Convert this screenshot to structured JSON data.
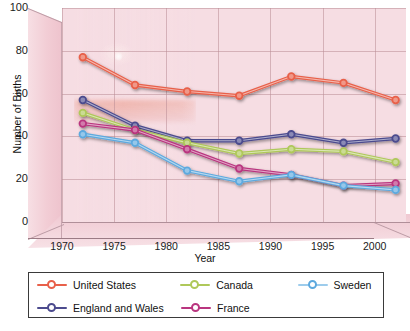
{
  "chart_data": {
    "type": "line",
    "title": "",
    "xlabel": "Year",
    "ylabel": "Number of Births",
    "x": [
      1972,
      1977,
      1982,
      1987,
      1992,
      1997,
      2002
    ],
    "xlim": [
      1970,
      2003
    ],
    "ylim": [
      0,
      100
    ],
    "xticks": [
      "1970",
      "1975",
      "1980",
      "1985",
      "1990",
      "1995",
      "2000"
    ],
    "xtick_values": [
      1970,
      1975,
      1980,
      1985,
      1990,
      1995,
      2000
    ],
    "yticks": [
      "0",
      "20",
      "40",
      "60",
      "80",
      "100"
    ],
    "ytick_values": [
      0,
      20,
      40,
      60,
      80,
      100
    ],
    "grid": true,
    "legend_position": "bottom",
    "series": [
      {
        "name": "United States",
        "color": "#E8604A",
        "values": [
          77,
          64,
          61,
          59,
          68,
          65,
          57
        ]
      },
      {
        "name": "England and Wales",
        "color": "#4C4B8E",
        "values": [
          57,
          45,
          38,
          38,
          41,
          37,
          39
        ]
      },
      {
        "name": "Canada",
        "color": "#AFC85A",
        "values": [
          51,
          43,
          37,
          32,
          34,
          33,
          28
        ]
      },
      {
        "name": "France",
        "color": "#B9357F",
        "values": [
          46,
          43,
          34,
          25,
          22,
          17,
          18
        ]
      },
      {
        "name": "Sweden",
        "color": "#5DA9DE",
        "values": [
          41,
          37,
          24,
          19,
          22,
          17,
          15
        ]
      }
    ]
  },
  "axes": {
    "y_title": "Number of Births",
    "x_title": "Year",
    "y_tick_labels": [
      "100",
      "80",
      "60",
      "40",
      "20",
      "0"
    ],
    "x_tick_labels": [
      "1970",
      "1975",
      "1980",
      "1985",
      "1990",
      "1995",
      "2000"
    ]
  },
  "legend": {
    "entries": [
      {
        "label": "United States",
        "color": "#E8604A"
      },
      {
        "label": "Canada",
        "color": "#AFC85A"
      },
      {
        "label": "Sweden",
        "color": "#5DA9DE"
      },
      {
        "label": "England and Wales",
        "color": "#4C4B8E"
      },
      {
        "label": "France",
        "color": "#B9357F"
      }
    ]
  },
  "theme": {
    "panel_background": "#F6DDE3",
    "wall_color": "#F2CDD5",
    "grid_color": "#B98C96",
    "text_color": "#111111"
  }
}
